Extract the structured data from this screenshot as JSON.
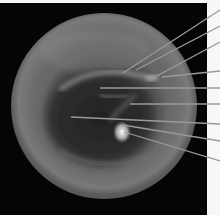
{
  "figure": {
    "width": 220,
    "height": 215,
    "panel": {
      "x": 0,
      "y": 3,
      "width": 207,
      "height": 212,
      "color": "#050505"
    },
    "disc": {
      "cx": 104,
      "cy": 106,
      "r": 93
    },
    "line_color": "#9a9a9a",
    "leader_lines": [
      {
        "x1": 123,
        "y1": 73,
        "x2": 220,
        "y2": 10
      },
      {
        "x1": 136,
        "y1": 70,
        "x2": 220,
        "y2": 26
      },
      {
        "x1": 153,
        "y1": 78,
        "x2": 220,
        "y2": 42
      },
      {
        "x1": 162,
        "y1": 77,
        "x2": 220,
        "y2": 71
      },
      {
        "x1": 100,
        "y1": 88,
        "x2": 220,
        "y2": 88
      },
      {
        "x1": 130,
        "y1": 104,
        "x2": 220,
        "y2": 104
      },
      {
        "x1": 71,
        "y1": 117,
        "x2": 220,
        "y2": 124
      },
      {
        "x1": 123,
        "y1": 125,
        "x2": 220,
        "y2": 141
      },
      {
        "x1": 124,
        "y1": 132,
        "x2": 220,
        "y2": 161
      }
    ],
    "labels": []
  }
}
